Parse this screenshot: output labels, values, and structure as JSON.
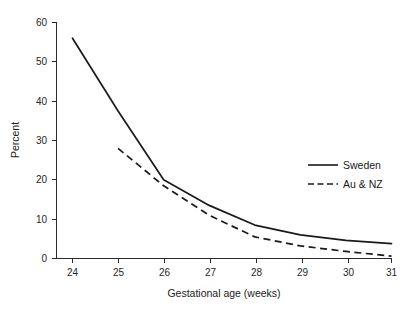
{
  "chart_data": {
    "type": "line",
    "title": "",
    "xlabel": "Gestational age (weeks)",
    "ylabel": "Percent",
    "x": [
      24,
      25,
      26,
      27,
      28,
      29,
      30,
      31
    ],
    "xticklabels": [
      "24",
      "25",
      "26",
      "27",
      "28",
      "29",
      "30",
      "31"
    ],
    "yticklabels": [
      "0",
      "10",
      "20",
      "30",
      "40",
      "50",
      "60"
    ],
    "yticks": [
      0,
      10,
      20,
      30,
      40,
      50,
      60
    ],
    "xlim": [
      24,
      31
    ],
    "ylim": [
      0,
      60
    ],
    "grid": false,
    "legend_position": "right-middle",
    "series": [
      {
        "name": "Sweden",
        "style": "solid",
        "color": "#1a1a1a",
        "x": [
          24,
          25,
          26,
          27,
          28,
          29,
          30,
          31
        ],
        "values": [
          56.0,
          37.5,
          20.0,
          13.5,
          8.5,
          6.0,
          4.6,
          3.8
        ]
      },
      {
        "name": "Au & NZ",
        "style": "dashed",
        "color": "#1a1a1a",
        "x": [
          25,
          26,
          27,
          28,
          29,
          30,
          31
        ],
        "values": [
          28.0,
          18.5,
          11.0,
          5.5,
          3.2,
          1.8,
          0.6
        ]
      }
    ]
  },
  "axes": {
    "y_title": "Percent",
    "x_title": "Gestational age (weeks)"
  },
  "legend": {
    "entries": [
      {
        "label": "Sweden",
        "style": "solid"
      },
      {
        "label": "Au & NZ",
        "style": "dashed"
      }
    ]
  }
}
